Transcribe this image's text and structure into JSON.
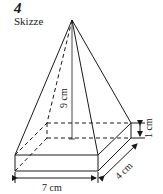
{
  "figure": {
    "number": "4",
    "title": "Skizze"
  },
  "labels": {
    "height": "9 cm",
    "slab_thickness": "1 cm",
    "depth": "4 cm",
    "width": "7 cm"
  },
  "colors": {
    "line": "#1a1a1a",
    "background": "#ffffff"
  }
}
